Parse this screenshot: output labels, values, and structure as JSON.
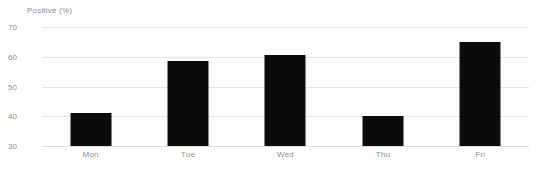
{
  "chart_data": {
    "type": "bar",
    "title": "",
    "subtitle": "",
    "xlabel": "",
    "ylabel": "Positive (%)",
    "categories": [
      "Mon",
      "Tue",
      "Wed",
      "Thu",
      "Fri"
    ],
    "values": [
      41,
      58.5,
      60.5,
      40,
      65
    ],
    "series": [
      {
        "name": "Positive (%)",
        "values": [
          41,
          58.5,
          60.5,
          40,
          65
        ]
      }
    ],
    "ylim": [
      30,
      70
    ],
    "yticks": [
      70,
      60,
      50,
      40,
      30
    ],
    "ytick_labels": [
      "70",
      "60",
      "50",
      "40",
      "30"
    ],
    "grid": true,
    "legend": false,
    "legend_position": "none",
    "bar_color": "#0c0c0c",
    "grid_color": "#e4e4e4",
    "axis_text_color": "#8d8d8d",
    "background_color": "#ffffff"
  }
}
